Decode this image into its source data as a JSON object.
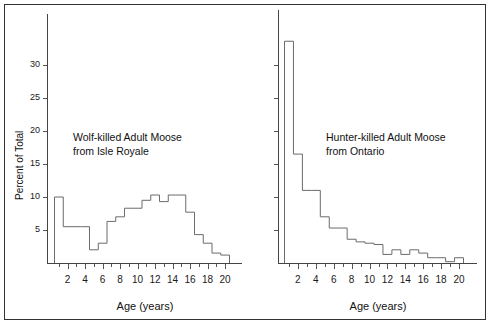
{
  "figure": {
    "background": "#ffffff",
    "frame_color": "#333333",
    "line_color": "#6b6b6b"
  },
  "axis": {
    "y_title": "Percent of Total",
    "x_title": "Age (years)",
    "y_ticks": [
      5,
      10,
      15,
      20,
      25,
      30
    ],
    "y_tick_labels": [
      "5",
      "10",
      "15",
      "20",
      "25",
      "30"
    ],
    "x_ticks": [
      2,
      4,
      6,
      8,
      10,
      12,
      14,
      16,
      18,
      20
    ],
    "x_tick_labels": [
      "2",
      "4",
      "6",
      "8",
      "10",
      "12",
      "14",
      "16",
      "18",
      "20"
    ]
  },
  "panels": {
    "left": {
      "annotation_line1": "Wolf-killed Adult Moose",
      "annotation_line2": "from Isle Royale"
    },
    "right": {
      "annotation_line1": "Hunter-killed Adult Moose",
      "annotation_line2": "from Ontario"
    }
  },
  "chart_data": [
    {
      "type": "bar",
      "title": "Wolf-killed Adult Moose from Isle Royale",
      "xlabel": "Age (years)",
      "ylabel": "Percent of Total",
      "xlim": [
        0.5,
        20.5
      ],
      "ylim": [
        0,
        33
      ],
      "grid": false,
      "legend": "none",
      "categories": [
        1,
        2,
        3,
        4,
        5,
        6,
        7,
        8,
        9,
        10,
        11,
        12,
        13,
        14,
        15,
        16,
        17,
        18,
        19,
        20
      ],
      "values": [
        10.0,
        5.5,
        5.5,
        5.5,
        2.0,
        3.0,
        6.3,
        7.0,
        8.3,
        8.3,
        9.5,
        10.3,
        9.3,
        10.3,
        10.3,
        7.7,
        4.3,
        3.0,
        1.5,
        1.2
      ]
    },
    {
      "type": "bar",
      "title": "Hunter-killed Adult Moose from Ontario",
      "xlabel": "Age (years)",
      "ylabel": "Percent of Total",
      "xlim": [
        0.5,
        20.5
      ],
      "ylim": [
        0,
        33
      ],
      "grid": false,
      "legend": "none",
      "categories": [
        1,
        2,
        3,
        4,
        5,
        6,
        7,
        8,
        9,
        10,
        11,
        12,
        13,
        14,
        15,
        16,
        17,
        18,
        19,
        20
      ],
      "values": [
        33.6,
        16.5,
        11.0,
        11.0,
        7.0,
        5.3,
        5.3,
        3.6,
        3.2,
        3.0,
        2.8,
        1.3,
        2.0,
        1.3,
        2.0,
        1.5,
        0.8,
        0.8,
        0.2,
        0.8
      ]
    }
  ]
}
